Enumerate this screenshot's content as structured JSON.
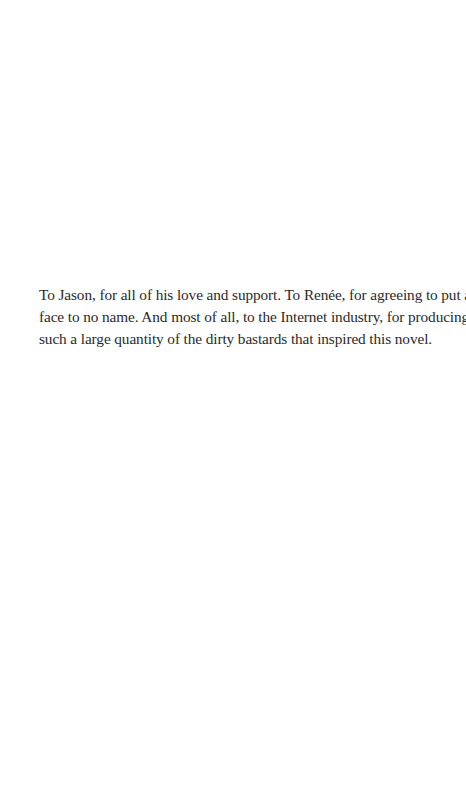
{
  "page": {
    "background": "#ffffff",
    "text_color": "#2a2a2a"
  },
  "dedication": {
    "lines": [
      "To Jason, for all of his love and support. To Renée, for agreeing to put a",
      "face to no name. And most of all, to the Internet industry, for producing",
      "such a large quantity of the dirty bastards that inspired this novel."
    ]
  }
}
